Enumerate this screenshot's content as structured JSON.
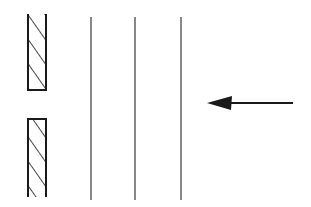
{
  "diagram": {
    "colors": {
      "stroke": "#1a1a1a",
      "wavefront": "#555555",
      "background": "#ffffff"
    },
    "barrier": {
      "segments": [
        {
          "name": "upper-slit-wall",
          "x": 28,
          "y": 14,
          "width": 18,
          "height": 76
        },
        {
          "name": "lower-slit-wall",
          "x": 28,
          "y": 119,
          "width": 18,
          "height": 78
        }
      ],
      "hatch": "diagonal"
    },
    "wavefronts": [
      {
        "x": 91,
        "y1": 17,
        "y2": 200
      },
      {
        "x": 135,
        "y1": 17,
        "y2": 200
      },
      {
        "x": 181,
        "y1": 17,
        "y2": 200
      }
    ],
    "arrow": {
      "direction": "left",
      "tail_x": 293,
      "tip_x": 207,
      "y": 103
    }
  }
}
